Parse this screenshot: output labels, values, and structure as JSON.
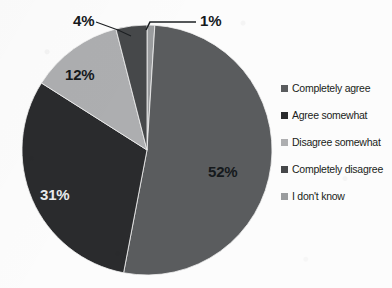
{
  "chart_data": {
    "type": "pie",
    "title": "",
    "subtitle": "",
    "xlabel": "",
    "ylabel": "",
    "grid": false,
    "legend_position": "right",
    "units": "percent",
    "total": 100,
    "start_angle_deg": 0,
    "direction": "clockwise",
    "categories": [
      "Completely agree",
      "Agree somewhat",
      "Disagree somewhat",
      "Completely disagree",
      "I don't know"
    ],
    "values": [
      52,
      31,
      12,
      4,
      1
    ],
    "labels": [
      "52%",
      "31%",
      "12%",
      "4%",
      "1%"
    ],
    "colors": [
      "#5a5c5e",
      "#2a2b2d",
      "#adaeb0",
      "#46484a",
      "#9a9c9e"
    ],
    "slices": [
      {
        "name": "Completely agree",
        "value": 52,
        "label": "52%",
        "color": "#5a5c5e",
        "label_placement": "inside",
        "label_color": "#15191c"
      },
      {
        "name": "Agree somewhat",
        "value": 31,
        "label": "31%",
        "color": "#2a2b2d",
        "label_placement": "inside",
        "label_color": "#e8eaec"
      },
      {
        "name": "Disagree somewhat",
        "value": 12,
        "label": "12%",
        "color": "#adaeb0",
        "label_placement": "inside",
        "label_color": "#15191c"
      },
      {
        "name": "Completely disagree",
        "value": 4,
        "label": "4%",
        "color": "#46484a",
        "label_placement": "outside-leader",
        "label_color": "#15191c"
      },
      {
        "name": "I don't know",
        "value": 1,
        "label": "1%",
        "color": "#9a9c9e",
        "label_placement": "outside-leader",
        "label_color": "#15191c"
      }
    ]
  },
  "legend": {
    "items": [
      {
        "label": "Completely agree",
        "color": "#5a5c5e"
      },
      {
        "label": "Agree somewhat",
        "color": "#2a2b2d"
      },
      {
        "label": "Disagree somewhat",
        "color": "#adaeb0"
      },
      {
        "label": "Completely disagree",
        "color": "#46484a"
      },
      {
        "label": "I don't know",
        "color": "#9a9c9e"
      }
    ]
  },
  "pie_labels": {
    "inside": [
      {
        "text": "52%",
        "left": 208,
        "top": 163
      },
      {
        "text": "31%",
        "left": 40,
        "top": 186
      },
      {
        "text": "12%",
        "left": 65,
        "top": 66
      }
    ],
    "outside": [
      {
        "text": "4%",
        "left": 73,
        "top": 12
      },
      {
        "text": "1%",
        "left": 200,
        "top": 12
      }
    ]
  }
}
